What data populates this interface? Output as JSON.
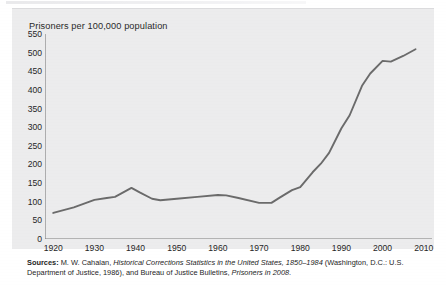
{
  "figure": {
    "panel_color": "#ececed",
    "line_color": "#6b6b6b",
    "axis_color": "#7a7a7a"
  },
  "chart_data": {
    "type": "line",
    "title": "Prisoners per 100,000 population",
    "xlabel": "",
    "ylabel": "Prisoners per 100,000 population",
    "xlim": [
      1918,
      2012
    ],
    "ylim": [
      0,
      550
    ],
    "grid": false,
    "legend": null,
    "y_ticks": [
      0,
      50,
      100,
      150,
      200,
      250,
      300,
      350,
      400,
      450,
      500,
      550
    ],
    "x_ticks": [
      1920,
      1930,
      1940,
      1950,
      1960,
      1970,
      1980,
      1990,
      2000,
      2010
    ],
    "series": [
      {
        "name": "Prisoners per 100,000 population",
        "x": [
          1920,
          1925,
          1930,
          1933,
          1935,
          1939,
          1941,
          1944,
          1946,
          1950,
          1955,
          1960,
          1962,
          1965,
          1970,
          1973,
          1975,
          1978,
          1980,
          1983,
          1985,
          1987,
          1990,
          1992,
          1995,
          1997,
          2000,
          2002,
          2005,
          2008
        ],
        "values": [
          70,
          85,
          105,
          110,
          113,
          137,
          125,
          108,
          104,
          108,
          113,
          118,
          117,
          110,
          97,
          97,
          111,
          131,
          139,
          179,
          202,
          231,
          297,
          332,
          411,
          444,
          478,
          476,
          491,
          509
        ]
      }
    ]
  },
  "sources": {
    "label": "Sources:",
    "line1_a": " M. W. Cahalan, ",
    "line1_italic": "Historical Corrections Statistics in the United States, 1850–1984",
    "line1_b": " (Washington, D.C.: U.S.",
    "line2_a": "Department of Justice, 1986), and Bureau of Justice Bulletins, ",
    "line2_italic": "Prisoners in 2008",
    "line2_b": "."
  }
}
